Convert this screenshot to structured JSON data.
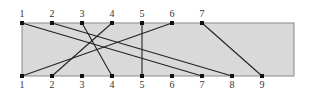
{
  "diagram": {
    "type": "bipartite-matching",
    "box": {
      "x": 22,
      "y": 23,
      "width": 272,
      "height": 53,
      "fill": "#d9d9d9",
      "stroke": "#888888"
    },
    "line_color": "#222222",
    "top_nodes": [
      {
        "label": "1",
        "x": 22
      },
      {
        "label": "2",
        "x": 52
      },
      {
        "label": "3",
        "x": 82
      },
      {
        "label": "4",
        "x": 112
      },
      {
        "label": "5",
        "x": 142
      },
      {
        "label": "6",
        "x": 172
      },
      {
        "label": "7",
        "x": 202
      }
    ],
    "bottom_nodes": [
      {
        "label": "1",
        "x": 22
      },
      {
        "label": "2",
        "x": 52
      },
      {
        "label": "3",
        "x": 82
      },
      {
        "label": "4",
        "x": 112
      },
      {
        "label": "5",
        "x": 142
      },
      {
        "label": "6",
        "x": 172
      },
      {
        "label": "7",
        "x": 202
      },
      {
        "label": "8",
        "x": 232
      },
      {
        "label": "9",
        "x": 262
      }
    ],
    "edges": [
      {
        "top": "1",
        "bottom": "7"
      },
      {
        "top": "2",
        "bottom": "8"
      },
      {
        "top": "3",
        "bottom": "4"
      },
      {
        "top": "4",
        "bottom": "2"
      },
      {
        "top": "5",
        "bottom": "5"
      },
      {
        "top": "6",
        "bottom": "1"
      },
      {
        "top": "7",
        "bottom": "9"
      }
    ]
  }
}
